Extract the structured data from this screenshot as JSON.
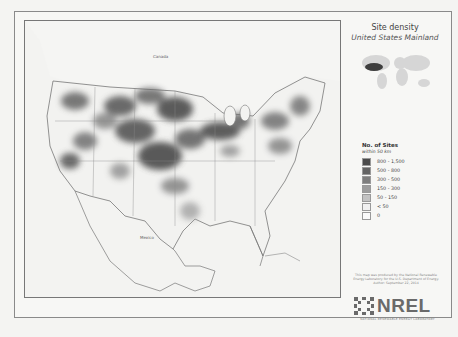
{
  "panel": {
    "title": "Site density",
    "subtitle": "United States Mainland",
    "legend_title": "No. of Sites",
    "legend_subtitle": "within 50 km",
    "legend": [
      {
        "label": "800 - 1,500",
        "color": "#4a4a4a"
      },
      {
        "label": "500 - 800",
        "color": "#636363"
      },
      {
        "label": "300 - 500",
        "color": "#7d7d7d"
      },
      {
        "label": "150 - 300",
        "color": "#9c9c9c"
      },
      {
        "label": "50 - 150",
        "color": "#c2c2c2"
      },
      {
        "label": "< 50",
        "color": "#f0f0f0"
      },
      {
        "label": "0",
        "color": "#fafafa"
      }
    ],
    "credit": "This map was produced by the National Renewable Energy Laboratory for the U.S. Department of Energy. Author: September 22, 2014",
    "logo_text": "NREL",
    "logo_tagline": "NATIONAL RENEWABLE ENERGY LABORATORY"
  },
  "map": {
    "labels": {
      "canada": "Canada",
      "mexico": "Mexico"
    }
  }
}
